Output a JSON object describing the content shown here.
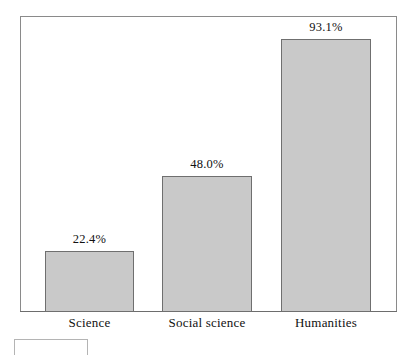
{
  "chart_data": {
    "type": "bar",
    "title": "",
    "subtitle": "",
    "xlabel": "",
    "ylabel": "",
    "categories": [
      "Science",
      "Social science",
      "Humanities"
    ],
    "values": [
      22.4,
      48.0,
      93.1
    ],
    "value_labels": [
      "22.4%",
      "48.0%",
      "93.1%"
    ],
    "ylim": [
      0,
      100
    ],
    "grid": false,
    "legend": null,
    "orientation": "vertical",
    "units": "percent",
    "bars": [
      {
        "category": "Science",
        "value": 22.4,
        "label": "22.4%"
      },
      {
        "category": "Social science",
        "value": 48.0,
        "label": "48.0%"
      },
      {
        "category": "Humanities",
        "value": 93.1,
        "label": "93.1%"
      }
    ]
  },
  "style": {
    "bar_fill": "#c9c9c9",
    "bar_border": "#6f6f6f",
    "frame_border": "#8a8a8a",
    "axis_line": "#6d6d6d",
    "background": "#ffffff",
    "text_color": "#111111"
  },
  "artifacts": {
    "cropped_box_label": ""
  }
}
